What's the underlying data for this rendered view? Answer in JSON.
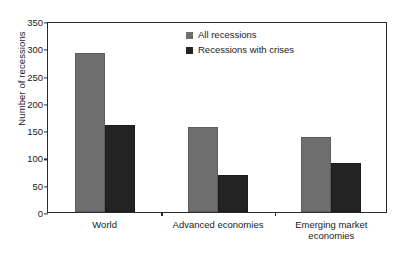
{
  "chart_data": {
    "type": "bar",
    "title": "",
    "xlabel": "",
    "ylabel": "Number of recessions",
    "ylim": [
      0,
      350
    ],
    "yticks": [
      0,
      50,
      100,
      150,
      200,
      250,
      300,
      350
    ],
    "grid": false,
    "legend_position": "top-right inside plot area",
    "categories": [
      "World",
      "Advanced economies",
      "Emerging market\neconomies"
    ],
    "series": [
      {
        "name": "All recessions",
        "color": "#6e6e6e",
        "values": [
          292,
          155,
          137
        ]
      },
      {
        "name": "Recessions with crises",
        "color": "#232323",
        "values": [
          159,
          68,
          90
        ]
      }
    ]
  },
  "legend": {
    "items": [
      {
        "label": "All recessions"
      },
      {
        "label": "Recessions with crises"
      }
    ]
  },
  "caption": {
    "text": ""
  }
}
